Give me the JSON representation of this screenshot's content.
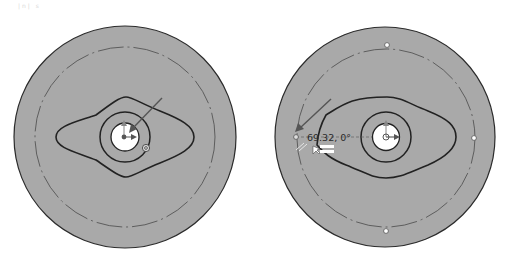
{
  "header": {
    "faint_label": "|n| s"
  },
  "colors": {
    "disk_fill": "#a9a9a9",
    "outline": "#2b2b2b",
    "bore_fill": "#ffffff",
    "construction_line": "#555555",
    "arrow": "#555555",
    "grip_fill": "#ffffff"
  },
  "views": [
    {
      "id": "left",
      "label": "before-drag",
      "center": [
        125,
        137
      ],
      "outer_radius": 111,
      "construction_circle_radius": 90,
      "inner_ring_radius": 25,
      "bore_radius": 14,
      "drag_arrow": {
        "from": [
          162,
          98
        ],
        "to": [
          133,
          128
        ]
      },
      "snap_marker": [
        146,
        148
      ]
    },
    {
      "id": "right",
      "label": "during-drag",
      "center": [
        385,
        137
      ],
      "outer_radius": 110,
      "construction_circle_radius": 89,
      "inner_ring_radius": 25,
      "bore_radius": 14,
      "grips": [
        [
          387,
          45
        ],
        [
          474,
          138
        ],
        [
          386,
          231
        ],
        [
          296,
          137
        ]
      ],
      "drag_arrow": {
        "from": [
          331,
          99
        ],
        "to": [
          297,
          130
        ]
      },
      "dimension": {
        "text": "69.32, 0°",
        "position": [
          307,
          134
        ]
      },
      "constraint_glyphs": {
        "tangent": "//",
        "equal": "="
      }
    }
  ]
}
